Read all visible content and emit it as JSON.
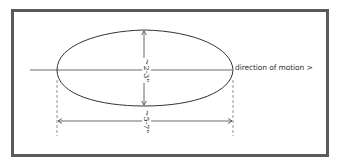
{
  "diagram": {
    "type": "hand-drawn dimension sketch",
    "shape": "ellipse (egg-shaped oval)",
    "labels": {
      "direction": "direction of motion >",
      "height": "~2-3\"",
      "length": "~5-7\""
    },
    "colors": {
      "frame_border": "#5a5a5a",
      "line": "#333333",
      "background": "#ffffff"
    }
  }
}
